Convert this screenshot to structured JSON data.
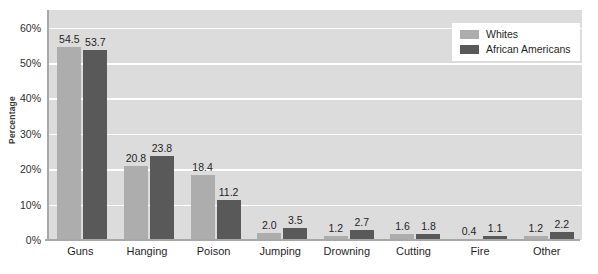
{
  "chart_data": {
    "type": "bar",
    "title": "",
    "xlabel": "",
    "ylabel": "Percentage",
    "ylim": [
      0,
      65
    ],
    "y_ticks": [
      0,
      10,
      20,
      30,
      40,
      50,
      60
    ],
    "y_tick_labels": [
      "0%",
      "10%",
      "20%",
      "30%",
      "40%",
      "50%",
      "60%"
    ],
    "grid": "horizontal",
    "legend_position": "top-right",
    "categories": [
      "Guns",
      "Hanging",
      "Poison",
      "Jumping",
      "Drowning",
      "Cutting",
      "Fire",
      "Other"
    ],
    "series": [
      {
        "name": "Whites",
        "color": "#adadad",
        "values": [
          54.5,
          20.8,
          18.4,
          2.0,
          1.2,
          1.6,
          0.4,
          1.2
        ],
        "labels": [
          "54.5",
          "20.8",
          "18.4",
          "2.0",
          "1.2",
          "1.6",
          "0.4",
          "1.2"
        ]
      },
      {
        "name": "African Americans",
        "color": "#595959",
        "values": [
          53.7,
          23.8,
          11.2,
          3.5,
          2.7,
          1.8,
          1.1,
          2.2
        ],
        "labels": [
          "53.7",
          "23.8",
          "11.2",
          "3.5",
          "2.7",
          "1.8",
          "1.1",
          "2.2"
        ]
      }
    ]
  },
  "colors": {
    "plot_background": "#dcdcdc",
    "gridline": "#ffffff",
    "axis_line": "#a8a8a8",
    "series_light": "#adadad",
    "series_dark": "#595959",
    "text": "#1f1f1f",
    "legend_background": "#ffffff"
  }
}
